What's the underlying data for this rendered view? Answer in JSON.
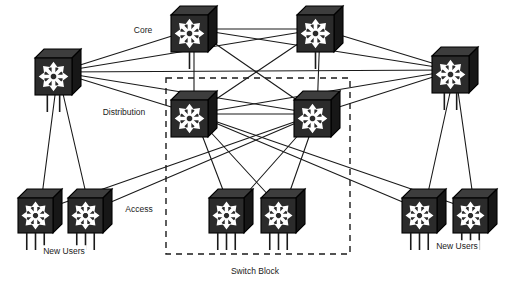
{
  "diagram": {
    "type": "network-topology",
    "background_color": "#ffffff",
    "line_color": "#1a1a1a",
    "device_color": "#2b2b2b",
    "labels": {
      "core": "Core",
      "distribution": "Distribution",
      "access": "Access",
      "new_users_left": "New Users",
      "new_users_right": "New Users",
      "switch_block": "Switch Block"
    },
    "label_positions": {
      "core": {
        "x": 143,
        "y": 31
      },
      "distribution": {
        "x": 124,
        "y": 113
      },
      "access": {
        "x": 139,
        "y": 210
      },
      "new_users_left": {
        "x": 64,
        "y": 252
      },
      "new_users_right": {
        "x": 457,
        "y": 247
      },
      "switch_block": {
        "x": 255,
        "y": 272
      }
    },
    "switch_block_box": {
      "x": 166,
      "y": 78,
      "width": 184,
      "height": 176
    },
    "icon_legend": "switch-icon",
    "nodes": [
      {
        "id": "core-left",
        "name": "core-switch-left",
        "tier": "core",
        "x": 58,
        "y": 72,
        "size": 46,
        "legs": 2
      },
      {
        "id": "core-top-1",
        "name": "core-switch-top-left",
        "tier": "core",
        "x": 194,
        "y": 29,
        "size": 46,
        "legs": 1
      },
      {
        "id": "core-top-2",
        "name": "core-switch-top-right",
        "tier": "core",
        "x": 320,
        "y": 29,
        "size": 46,
        "legs": 1
      },
      {
        "id": "core-right",
        "name": "core-switch-right",
        "tier": "core",
        "x": 455,
        "y": 70,
        "size": 46,
        "legs": 2
      },
      {
        "id": "dist-left",
        "name": "distribution-switch-left",
        "tier": "distribution",
        "x": 194,
        "y": 114,
        "size": 46,
        "legs": 0
      },
      {
        "id": "dist-right",
        "name": "distribution-switch-right",
        "tier": "distribution",
        "x": 317,
        "y": 114,
        "size": 46,
        "legs": 0
      },
      {
        "id": "acc-1",
        "name": "access-switch-1",
        "tier": "access",
        "x": 40,
        "y": 211,
        "size": 44,
        "legs": 3
      },
      {
        "id": "acc-2",
        "name": "access-switch-2",
        "tier": "access",
        "x": 90,
        "y": 211,
        "size": 44,
        "legs": 3
      },
      {
        "id": "acc-3",
        "name": "access-switch-3",
        "tier": "access",
        "x": 231,
        "y": 211,
        "size": 44,
        "legs": 3
      },
      {
        "id": "acc-4",
        "name": "access-switch-4",
        "tier": "access",
        "x": 283,
        "y": 211,
        "size": 44,
        "legs": 3
      },
      {
        "id": "acc-5",
        "name": "access-switch-5",
        "tier": "access",
        "x": 424,
        "y": 211,
        "size": 44,
        "legs": 3
      },
      {
        "id": "acc-6",
        "name": "access-switch-6",
        "tier": "access",
        "x": 475,
        "y": 211,
        "size": 44,
        "legs": 3
      }
    ],
    "links": [
      {
        "from": "core-left",
        "to": "core-top-1"
      },
      {
        "from": "core-left",
        "to": "core-top-2"
      },
      {
        "from": "core-top-1",
        "to": "core-top-2"
      },
      {
        "from": "core-top-1",
        "to": "core-right"
      },
      {
        "from": "core-top-2",
        "to": "core-right"
      },
      {
        "from": "core-left",
        "to": "core-right"
      },
      {
        "from": "core-top-1",
        "to": "dist-left"
      },
      {
        "from": "core-top-1",
        "to": "dist-right"
      },
      {
        "from": "core-top-2",
        "to": "dist-left"
      },
      {
        "from": "core-top-2",
        "to": "dist-right"
      },
      {
        "from": "core-left",
        "to": "dist-left"
      },
      {
        "from": "core-left",
        "to": "dist-right"
      },
      {
        "from": "core-right",
        "to": "dist-left"
      },
      {
        "from": "core-right",
        "to": "dist-right"
      },
      {
        "from": "dist-left",
        "to": "dist-right"
      },
      {
        "from": "dist-left",
        "to": "acc-3"
      },
      {
        "from": "dist-left",
        "to": "acc-4"
      },
      {
        "from": "dist-right",
        "to": "acc-3"
      },
      {
        "from": "dist-right",
        "to": "acc-4"
      },
      {
        "from": "dist-left",
        "to": "acc-5"
      },
      {
        "from": "dist-left",
        "to": "acc-6"
      },
      {
        "from": "dist-right",
        "to": "acc-1"
      },
      {
        "from": "dist-right",
        "to": "acc-2"
      },
      {
        "from": "core-left",
        "to": "acc-1"
      },
      {
        "from": "core-left",
        "to": "acc-2"
      },
      {
        "from": "core-right",
        "to": "acc-5"
      },
      {
        "from": "core-right",
        "to": "acc-6"
      }
    ]
  }
}
